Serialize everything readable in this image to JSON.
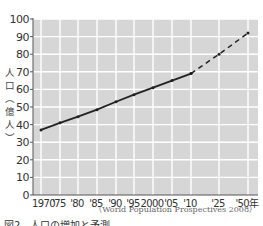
{
  "chart_data": {
    "type": "line",
    "title": "",
    "xlabel": "",
    "ylabel": "人口（億人）",
    "ylim": [
      0,
      100
    ],
    "yticks": [
      0,
      10,
      20,
      30,
      40,
      50,
      60,
      70,
      80,
      90,
      100
    ],
    "grid": true,
    "legend": null,
    "categories": [
      "1970",
      "'75",
      "'80",
      "'85",
      "'90",
      "'95",
      "2000",
      "'05",
      "'10",
      "'25",
      "'50年"
    ],
    "x": [
      1970,
      1975,
      1980,
      1985,
      1990,
      1995,
      2000,
      2005,
      2010,
      2025,
      2050
    ],
    "series": [
      {
        "name": "実績 (actual)",
        "style": "solid",
        "x": [
          1970,
          1975,
          1980,
          1985,
          1990,
          1995,
          2000,
          2005,
          2010
        ],
        "values": [
          37,
          41,
          44.5,
          48.5,
          53,
          57,
          61,
          65,
          69
        ]
      },
      {
        "name": "予測 (projection)",
        "style": "dashed",
        "x": [
          2010,
          2025,
          2050
        ],
        "values": [
          69,
          80,
          92
        ]
      }
    ],
    "source": "（World Population Prospectives 2008）",
    "caption": "図2　人口の増加と予測"
  },
  "axis": {
    "ylabel_chars": [
      "人",
      "口",
      "︵",
      "億",
      "人",
      "︶"
    ]
  }
}
